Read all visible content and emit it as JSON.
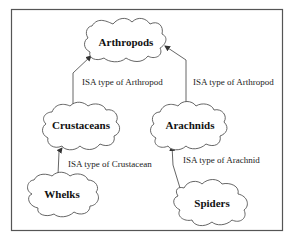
{
  "diagram": {
    "type": "isa-hierarchy",
    "nodes": [
      {
        "id": "arthropods",
        "label": "Arthropods"
      },
      {
        "id": "crustaceans",
        "label": "Crustaceans"
      },
      {
        "id": "arachnids",
        "label": "Arachnids"
      },
      {
        "id": "whelks",
        "label": "Whelks"
      },
      {
        "id": "spiders",
        "label": "Spiders"
      }
    ],
    "edges": [
      {
        "from": "crustaceans",
        "to": "arthropods",
        "label": "ISA type of Arthropod"
      },
      {
        "from": "arachnids",
        "to": "arthropods",
        "label": "ISA type of Arthropod"
      },
      {
        "from": "whelks",
        "to": "crustaceans",
        "label": "ISA type of Crustacean"
      },
      {
        "from": "spiders",
        "to": "arachnids",
        "label": "ISA type of Arachnid"
      }
    ]
  }
}
